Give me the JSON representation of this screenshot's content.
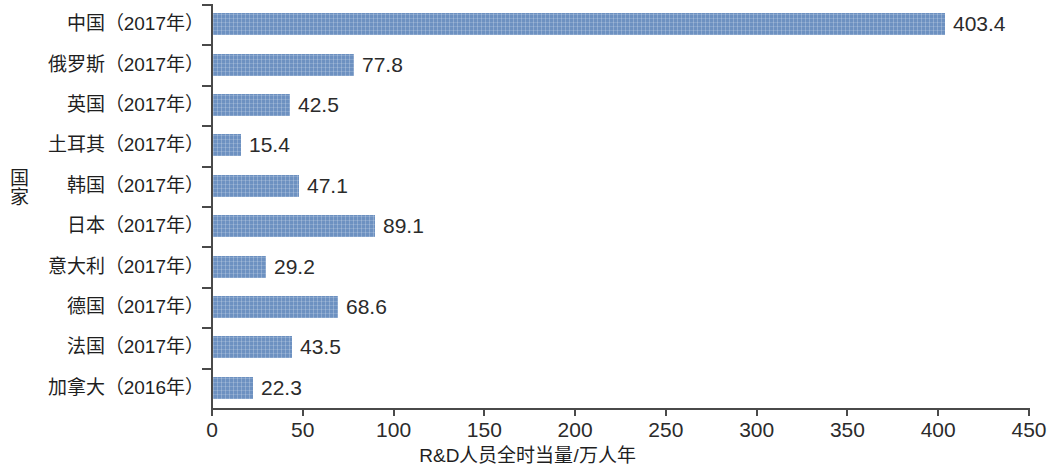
{
  "chart_data": {
    "type": "bar",
    "orientation": "horizontal",
    "title": "",
    "subtitle": "",
    "xlabel": "R&D人员全时当量/万人年",
    "ylabel": "国家",
    "xlim": [
      0,
      450
    ],
    "xticks": [
      0,
      50,
      100,
      150,
      200,
      250,
      300,
      350,
      400,
      450
    ],
    "xtick_labels": [
      "0",
      "50",
      "100",
      "150",
      "200",
      "250",
      "300",
      "350",
      "400",
      "450"
    ],
    "grid": false,
    "legend": false,
    "bar_color": "#6d91c1",
    "axis_color": "#4a4a4a",
    "background": "#ffffff",
    "categories": [
      "中国（2017年）",
      "俄罗斯（2017年）",
      "英国（2017年）",
      "土耳其（2017年）",
      "韩国（2017年）",
      "日本（2017年）",
      "意大利（2017年）",
      "德国（2017年）",
      "法国（2017年）",
      "加拿大（2016年）"
    ],
    "values": [
      403.4,
      77.8,
      42.5,
      15.4,
      47.1,
      89.1,
      29.2,
      68.6,
      43.5,
      22.3
    ],
    "value_labels": [
      "403.4",
      "77.8",
      "42.5",
      "15.4",
      "47.1",
      "89.1",
      "29.2",
      "68.6",
      "43.5",
      "22.3"
    ]
  }
}
